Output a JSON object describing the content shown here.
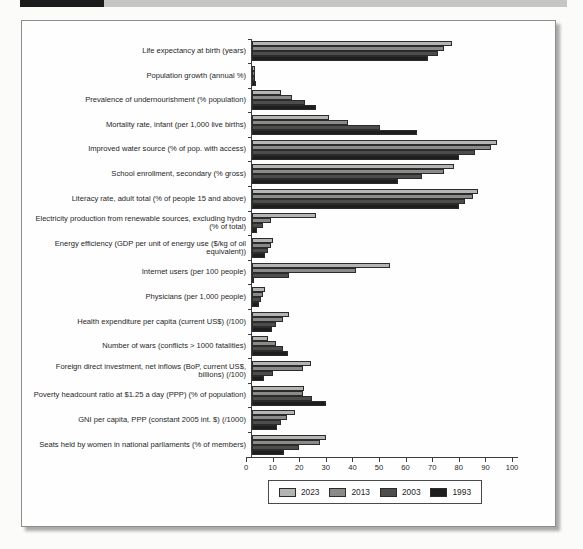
{
  "chart_data": {
    "type": "bar",
    "orientation": "horizontal",
    "title": "",
    "xlabel": "",
    "ylabel": "",
    "xlim": [
      0,
      100
    ],
    "xticks": [
      0,
      10,
      20,
      30,
      40,
      50,
      60,
      70,
      80,
      90,
      100
    ],
    "grid": false,
    "legend_position": "bottom",
    "categories": [
      "Life expectancy at birth (years)",
      "Population growth (annual %)",
      "Prevalence of undernourishment (% population)",
      "Mortality rate, infant (per 1,000 live births)",
      "Improved water source (% of pop. with access)",
      "School enrollment, secondary (% gross)",
      "Literacy rate, adult total (% of people 15 and above)",
      "Electricity production from renewable sources, excluding hydro (% of total)",
      "Energy efficiency (GDP per unit of energy use ($/kg of oil equivalent))",
      "Internet users (per 100 people)",
      "Physicians (per 1,000 people)",
      "Health expenditure per capita (current US$) (/100)",
      "Number of wars (conflicts > 1000 fatalities)",
      "Foreign direct investment, net inflows (BoP, current US$, billions) (/100)",
      "Poverty headcount ratio at $1.25 a day (PPP) (% of population)",
      "GNI per capita, PPP (constant 2005 int. $) (/1000)",
      "Seats held by women in national parliaments (% of members)"
    ],
    "series": [
      {
        "name": "2023",
        "color": "#b4b4b2",
        "values": [
          75,
          1.1,
          11,
          29,
          92,
          76,
          85,
          24,
          8,
          52,
          4.8,
          14,
          6,
          22,
          19.5,
          16,
          28
        ]
      },
      {
        "name": "2013",
        "color": "#8a8a88",
        "values": [
          72,
          1.2,
          15,
          36,
          90,
          72,
          83,
          7,
          7,
          39,
          4,
          11.5,
          9,
          19,
          19,
          13,
          25.5
        ]
      },
      {
        "name": "2003",
        "color": "#4d4d4c",
        "values": [
          70,
          1.3,
          20,
          48,
          84,
          64,
          80,
          4,
          6,
          14,
          3.4,
          9,
          11.5,
          8,
          22.5,
          11,
          17.5
        ]
      },
      {
        "name": "1993",
        "color": "#1e1e1e",
        "values": [
          66,
          1.5,
          24,
          62,
          78,
          55,
          78,
          2,
          5,
          0.5,
          2.8,
          7.5,
          13.5,
          4.5,
          28,
          9.5,
          12
        ]
      }
    ]
  }
}
